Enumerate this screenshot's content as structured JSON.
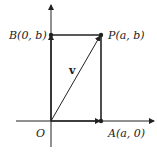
{
  "diagram": {
    "title": "",
    "axes": {
      "origin_label": "O",
      "x_axis": true,
      "y_axis": true
    },
    "points": {
      "O": {
        "label": "O"
      },
      "A": {
        "name": "A",
        "coords": "(a, 0)",
        "label": "A(a, 0)"
      },
      "B": {
        "name": "B",
        "coords": "(0, b)",
        "label": "B(0, b)"
      },
      "P": {
        "name": "P",
        "coords": "(a, b)",
        "label": "P(a, b)"
      }
    },
    "vector": {
      "label": "v",
      "from": "O",
      "to": "P"
    },
    "colors": {
      "stroke": "#222222",
      "background": "#ffffff"
    }
  }
}
